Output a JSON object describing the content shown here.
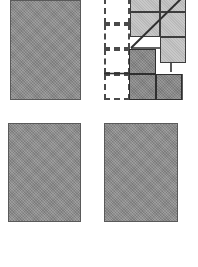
{
  "figure": {
    "canvas": {
      "width": 198,
      "height": 267
    },
    "colors": {
      "solid_fill": "#8e8e8e",
      "light_tile_fill": "#c2c2c2",
      "dark_tile_fill": "#8a8a8a",
      "outline": "#3d3d3d",
      "dashed_outline": "#4a4a4a",
      "background": "#ffffff"
    },
    "panels": [
      {
        "name": "top-left-rectangle",
        "kind": "solid-rectangle",
        "x": 10,
        "y": 0,
        "width": 71,
        "height": 100
      },
      {
        "name": "bottom-left-rectangle",
        "kind": "solid-rectangle",
        "x": 8,
        "y": 123,
        "width": 73,
        "height": 99
      },
      {
        "name": "bottom-right-rectangle",
        "kind": "solid-rectangle",
        "x": 104,
        "y": 123,
        "width": 74,
        "height": 99
      }
    ],
    "composite": {
      "name": "top-right-composite",
      "x": 104,
      "y": 0,
      "width": 84,
      "height": 100,
      "dashed_cells": [
        {
          "name": "dashed-cell-r1c1",
          "x": 104,
          "y": -2,
          "width": 26,
          "height": 26
        },
        {
          "name": "dashed-cell-r2c1",
          "x": 104,
          "y": 24,
          "width": 26,
          "height": 25
        },
        {
          "name": "dashed-cell-r3c1",
          "x": 104,
          "y": 49,
          "width": 26,
          "height": 25
        },
        {
          "name": "dashed-cell-r4c1",
          "x": 104,
          "y": 74,
          "width": 26,
          "height": 26
        },
        {
          "name": "dashed-cell-r3c2",
          "x": 130,
          "y": 49,
          "width": 26,
          "height": 12
        }
      ],
      "light_tiles": [
        {
          "name": "light-tile-a",
          "x": 130,
          "y": -10,
          "width": 30,
          "height": 22
        },
        {
          "name": "light-tile-b",
          "x": 160,
          "y": -10,
          "width": 26,
          "height": 22
        },
        {
          "name": "light-tile-c",
          "x": 130,
          "y": 12,
          "width": 30,
          "height": 25
        },
        {
          "name": "light-tile-d",
          "x": 160,
          "y": 12,
          "width": 26,
          "height": 25
        },
        {
          "name": "light-tile-e",
          "x": 160,
          "y": 37,
          "width": 26,
          "height": 26
        }
      ],
      "dark_tiles": [
        {
          "name": "dark-tile-a",
          "x": 129,
          "y": 49,
          "width": 27,
          "height": 25
        },
        {
          "name": "dark-tile-b",
          "x": 129,
          "y": 74,
          "width": 27,
          "height": 26
        },
        {
          "name": "dark-tile-c",
          "x": 156,
          "y": 74,
          "width": 26,
          "height": 26
        }
      ],
      "diagonal": {
        "name": "diagonal-line",
        "x1": 131,
        "y1": 48,
        "x2": 188,
        "y2": -8
      },
      "connectors": [
        {
          "name": "connector-hairline-top",
          "x": 131,
          "y": 37,
          "width": 29,
          "height": 2
        },
        {
          "name": "connector-hairline-left",
          "x": 104,
          "y": 73,
          "width": 52,
          "height": 2
        },
        {
          "name": "connector-stub-right",
          "x": 171,
          "y": 63,
          "width": 2,
          "height": 10
        }
      ]
    }
  }
}
